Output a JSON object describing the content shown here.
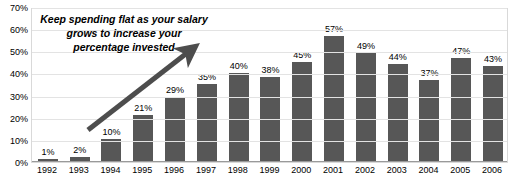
{
  "chart_data": {
    "type": "bar",
    "title": "",
    "xlabel": "",
    "ylabel": "",
    "categories": [
      "1992",
      "1993",
      "1994",
      "1995",
      "1996",
      "1997",
      "1998",
      "1999",
      "2000",
      "2001",
      "2002",
      "2003",
      "2004",
      "2005",
      "2006"
    ],
    "values": [
      1,
      2,
      10,
      21,
      29,
      35,
      40,
      38,
      45,
      57,
      49,
      44,
      37,
      47,
      43
    ],
    "data_labels": [
      "1%",
      "2%",
      "10%",
      "21%",
      "29%",
      "35%",
      "40%",
      "38%",
      "45%",
      "57%",
      "49%",
      "44%",
      "37%",
      "47%",
      "43%"
    ],
    "ylim": [
      0,
      70
    ],
    "ytick_values": [
      0,
      10,
      20,
      30,
      40,
      50,
      60,
      70
    ],
    "ytick_labels": [
      "0%",
      "10%",
      "20%",
      "30%",
      "40%",
      "50%",
      "60%",
      "70%"
    ],
    "grid": true,
    "legend": false,
    "series_color": "#575757",
    "gridline_color": "#e3e3e3",
    "plot_border_color": "#d9d9d9",
    "annotations": [
      {
        "name": "trend-callout",
        "text": "Keep spending flat as your salary grows to increase your percentage invested",
        "style": "bold-italic",
        "arrow": {
          "from_x": 88,
          "from_y": 130,
          "to_x": 196,
          "to_y": 46,
          "color": "#4d4d4d"
        }
      }
    ]
  }
}
